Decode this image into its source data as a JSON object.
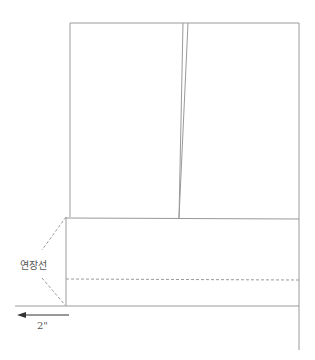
{
  "diagram": {
    "extension_label": "연장선",
    "measure_label": "2\"",
    "colors": {
      "line": "#9a9a9a",
      "dashed": "#9a9a9a",
      "arrow": "#333333",
      "text": "#555555"
    }
  }
}
